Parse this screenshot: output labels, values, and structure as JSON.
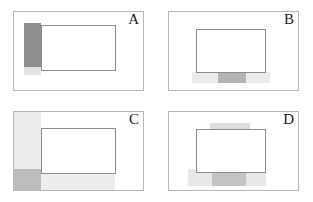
{
  "figure": {
    "title": "",
    "background": "#ffffff",
    "width": 313,
    "height": 202,
    "panel_border_color": "#b8b8b8",
    "rect_border_color": "#8c8c8c"
  },
  "chart_data": {
    "type": "diagram",
    "title": "",
    "xlabel": "",
    "ylabel": "",
    "grid": false,
    "legend": "none",
    "panels": [
      {
        "id": "A",
        "label": "A",
        "frame": {
          "x": 13,
          "y": 11,
          "w": 131,
          "h": 80
        },
        "rect": {
          "x": 28,
          "y": 14,
          "w": 75,
          "h": 46
        },
        "bands": [
          {
            "name": "dark-vertical-band",
            "x": 11,
            "y": 12,
            "w": 17,
            "h": 44,
            "color": "#8f8f8f",
            "opacity": 1
          },
          {
            "name": "light-vertical-band-extension",
            "x": 11,
            "y": 56,
            "w": 17,
            "h": 8,
            "color": "#e2e2e2",
            "opacity": 1
          }
        ]
      },
      {
        "id": "B",
        "label": "B",
        "frame": {
          "x": 168,
          "y": 11,
          "w": 131,
          "h": 80
        },
        "rect": {
          "x": 28,
          "y": 18,
          "w": 70,
          "h": 44
        },
        "bands": [
          {
            "name": "light-horizontal-band",
            "x": 24,
            "y": 61,
            "w": 78,
            "h": 11,
            "color": "#ebebeb",
            "opacity": 1
          },
          {
            "name": "dark-horizontal-band",
            "x": 50,
            "y": 61,
            "w": 28,
            "h": 11,
            "color": "#b4b4b4",
            "opacity": 1
          }
        ]
      },
      {
        "id": "C",
        "label": "C",
        "frame": {
          "x": 13,
          "y": 111,
          "w": 131,
          "h": 80
        },
        "rect": {
          "x": 28,
          "y": 17,
          "w": 75,
          "h": 46
        },
        "bands": [
          {
            "name": "light-vertical-band",
            "x": 0,
            "y": 0,
            "w": 28,
            "h": 79,
            "color": "#ececec",
            "opacity": 1
          },
          {
            "name": "light-horizontal-band",
            "x": 0,
            "y": 58,
            "w": 102,
            "h": 21,
            "color": "#ededed",
            "opacity": 1
          },
          {
            "name": "dark-overlap-square",
            "x": 0,
            "y": 58,
            "w": 28,
            "h": 21,
            "color": "#bdbdbd",
            "opacity": 1
          }
        ]
      },
      {
        "id": "D",
        "label": "D",
        "frame": {
          "x": 168,
          "y": 111,
          "w": 131,
          "h": 80
        },
        "rect": {
          "x": 28,
          "y": 18,
          "w": 70,
          "h": 44
        },
        "bands": [
          {
            "name": "top-light-band",
            "x": 42,
            "y": 12,
            "w": 40,
            "h": 17,
            "color": "#e6e6e6",
            "opacity": 1
          },
          {
            "name": "top-light-band-inner",
            "x": 42,
            "y": 12,
            "w": 40,
            "h": 8,
            "color": "#dedede",
            "opacity": 1
          },
          {
            "name": "bottom-light-band",
            "x": 20,
            "y": 58,
            "w": 78,
            "h": 17,
            "color": "#e8e8e8",
            "opacity": 1
          },
          {
            "name": "bottom-dark-band",
            "x": 44,
            "y": 58,
            "w": 34,
            "h": 17,
            "color": "#c4c4c4",
            "opacity": 1
          }
        ]
      }
    ]
  }
}
